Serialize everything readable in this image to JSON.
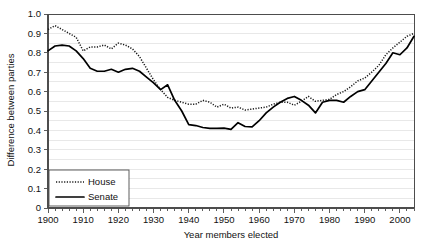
{
  "chart_data": {
    "type": "line",
    "title": "",
    "xlabel": "Year members elected",
    "ylabel": "Difference between parties",
    "xlim": [
      1900,
      2004
    ],
    "ylim": [
      0,
      1.0
    ],
    "grid": true,
    "grid_interval": 0.05,
    "legend_position": "bottom-left",
    "xticks": [
      1900,
      1910,
      1920,
      1930,
      1940,
      1950,
      1960,
      1970,
      1980,
      1990,
      2000
    ],
    "xtick_labels": [
      "1900",
      "1910",
      "1920",
      "1930",
      "1940",
      "1950",
      "1960",
      "1970",
      "1980",
      "1990",
      "2000"
    ],
    "xtick_minor_interval": 2,
    "yticks": [
      0,
      0.1,
      0.2,
      0.3,
      0.4,
      0.5,
      0.6,
      0.7,
      0.8,
      0.9,
      1.0
    ],
    "ytick_labels": [
      "0",
      "0.1",
      "0.2",
      "0.3",
      "0.4",
      "0.5",
      "0.6",
      "0.7",
      "0.8",
      "0.9",
      "1.0"
    ],
    "x": [
      1900,
      1902,
      1904,
      1906,
      1908,
      1910,
      1912,
      1914,
      1916,
      1918,
      1920,
      1922,
      1924,
      1926,
      1928,
      1930,
      1932,
      1934,
      1936,
      1938,
      1940,
      1942,
      1944,
      1946,
      1948,
      1950,
      1952,
      1954,
      1956,
      1958,
      1960,
      1962,
      1964,
      1966,
      1968,
      1970,
      1972,
      1974,
      1976,
      1978,
      1980,
      1982,
      1984,
      1986,
      1988,
      1990,
      1992,
      1994,
      1996,
      1998,
      2000,
      2002,
      2004
    ],
    "series": [
      {
        "name": "House",
        "style": "dotted",
        "color": "#1a1a1a",
        "values": [
          0.92,
          0.94,
          0.92,
          0.9,
          0.88,
          0.81,
          0.83,
          0.83,
          0.84,
          0.82,
          0.85,
          0.84,
          0.82,
          0.78,
          0.72,
          0.66,
          0.61,
          0.57,
          0.555,
          0.545,
          0.535,
          0.535,
          0.555,
          0.545,
          0.52,
          0.535,
          0.515,
          0.52,
          0.505,
          0.51,
          0.515,
          0.52,
          0.535,
          0.545,
          0.545,
          0.53,
          0.55,
          0.575,
          0.55,
          0.555,
          0.56,
          0.585,
          0.6,
          0.625,
          0.655,
          0.67,
          0.7,
          0.735,
          0.79,
          0.825,
          0.855,
          0.885,
          0.9
        ]
      },
      {
        "name": "Senate",
        "style": "solid",
        "color": "#000000",
        "values": [
          0.81,
          0.835,
          0.84,
          0.835,
          0.81,
          0.77,
          0.72,
          0.705,
          0.705,
          0.715,
          0.7,
          0.715,
          0.72,
          0.705,
          0.675,
          0.645,
          0.61,
          0.635,
          0.555,
          0.5,
          0.43,
          0.425,
          0.415,
          0.41,
          0.41,
          0.412,
          0.405,
          0.44,
          0.42,
          0.418,
          0.45,
          0.49,
          0.52,
          0.545,
          0.565,
          0.575,
          0.555,
          0.53,
          0.49,
          0.545,
          0.555,
          0.555,
          0.545,
          0.575,
          0.6,
          0.61,
          0.655,
          0.7,
          0.745,
          0.8,
          0.79,
          0.825,
          0.885
        ]
      }
    ]
  },
  "legend": {
    "items": [
      {
        "label": "House",
        "style": "dotted"
      },
      {
        "label": "Senate",
        "style": "solid"
      }
    ]
  }
}
